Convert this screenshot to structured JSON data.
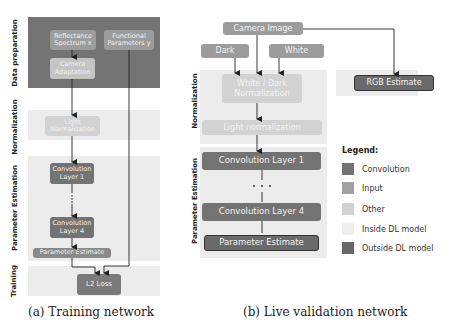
{
  "colors": {
    "convolution": "#707070",
    "input": "#9c9c9c",
    "other": "#cfcfcf",
    "inside_dl": "#ececec",
    "outside_dl": "#6a6a6a",
    "data_prep_band": "#737373",
    "band_light": "#ececec"
  },
  "training": {
    "bands": {
      "data_preparation": "Data preparation",
      "normalization": "Normalization",
      "parameter_estimation": "Parameter Estimation",
      "training": "Training"
    },
    "boxes": {
      "reflectance": "Reflectance Spectrum x",
      "reflectance_l1": "Reflectance",
      "reflectance_l2": "Spectrum x",
      "functional_l1": "Functional",
      "functional_l2": "Parameters y",
      "camera_l1": "Camera",
      "camera_l2": "Adaptation",
      "light_l1": "Light",
      "light_l2": "Normalization",
      "conv1_l1": "Convolution",
      "conv1_l2": "Layer 1",
      "dots": "⋮",
      "conv4_l1": "Convolution",
      "conv4_l2": "Layer 4",
      "param_estimate": "Parameter Estimate",
      "l2_loss": "L2 Loss"
    },
    "caption": "(a) Training network"
  },
  "validation": {
    "bands": {
      "normalization": "Normalization",
      "parameter_estimation": "Parameter Estimation"
    },
    "boxes": {
      "camera_image": "Camera Image",
      "dark": "Dark",
      "white": "White",
      "wd_l1": "White / Dark",
      "wd_l2": "Normalization",
      "light_norm": "Light normalization",
      "conv1": "Convolution Layer 1",
      "dots": "• • •",
      "conv4": "Convolution Layer 4",
      "param_estimate": "Parameter Estimate",
      "rgb_estimate": "RGB Estimate"
    },
    "caption": "(b) Live validation network"
  },
  "legend": {
    "title": "Legend:",
    "items": [
      {
        "label": "Convolution",
        "color": "#727272"
      },
      {
        "label": "Input",
        "color": "#a0a0a0"
      },
      {
        "label": "Other",
        "color": "#d2d2d2"
      },
      {
        "label": "Inside DL model",
        "color": "#eeeeee"
      },
      {
        "label": "Outside DL model",
        "color": "#666666"
      }
    ]
  }
}
